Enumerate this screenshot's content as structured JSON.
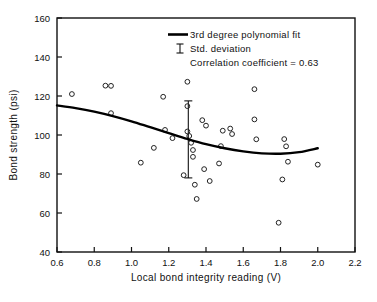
{
  "chart_data": {
    "type": "scatter",
    "title": "",
    "xlabel": "Local bond integrity reading (V)",
    "ylabel": "Bond strength (psi)",
    "xlim": [
      0.6,
      2.2
    ],
    "ylim": [
      40,
      160
    ],
    "xticks": [
      "0.6",
      "0.8",
      "1.0",
      "1.2",
      "1.4",
      "1.6",
      "1.8",
      "2.0",
      "2.2"
    ],
    "xtick_values": [
      0.6,
      0.8,
      1.0,
      1.2,
      1.4,
      1.6,
      1.8,
      2.0,
      2.2
    ],
    "yticks": [
      "40",
      "60",
      "80",
      "100",
      "120",
      "140",
      "160"
    ],
    "ytick_values": [
      40,
      60,
      80,
      100,
      120,
      140,
      160
    ],
    "grid": false,
    "legend_position": "top-right",
    "marker_style": "open-circle",
    "series": [
      {
        "name": "Bond strength measurements",
        "type": "scatter",
        "points": [
          [
            0.68,
            121.0
          ],
          [
            0.86,
            125.3
          ],
          [
            0.89,
            125.2
          ],
          [
            0.89,
            111.2
          ],
          [
            1.05,
            85.8
          ],
          [
            1.12,
            93.4
          ],
          [
            1.17,
            119.6
          ],
          [
            1.18,
            102.6
          ],
          [
            1.22,
            98.4
          ],
          [
            1.28,
            79.4
          ],
          [
            1.3,
            127.3
          ],
          [
            1.3,
            114.8
          ],
          [
            1.3,
            101.8
          ],
          [
            1.31,
            99.5
          ],
          [
            1.32,
            96.0
          ],
          [
            1.33,
            92.3
          ],
          [
            1.33,
            88.8
          ],
          [
            1.34,
            74.5
          ],
          [
            1.35,
            67.2
          ],
          [
            1.38,
            107.6
          ],
          [
            1.39,
            82.5
          ],
          [
            1.4,
            104.8
          ],
          [
            1.42,
            76.4
          ],
          [
            1.47,
            85.4
          ],
          [
            1.48,
            94.3
          ],
          [
            1.49,
            102.2
          ],
          [
            1.53,
            103.3
          ],
          [
            1.54,
            100.5
          ],
          [
            1.66,
            123.5
          ],
          [
            1.66,
            108.0
          ],
          [
            1.67,
            97.8
          ],
          [
            1.79,
            55.0
          ],
          [
            1.81,
            77.2
          ],
          [
            1.82,
            97.9
          ],
          [
            1.83,
            94.2
          ],
          [
            1.84,
            86.3
          ],
          [
            2.0,
            84.8
          ]
        ]
      },
      {
        "name": "3rd degree polynomial fit",
        "type": "line",
        "points": [
          [
            0.6,
            115.2
          ],
          [
            0.7,
            113.8
          ],
          [
            0.8,
            112.0
          ],
          [
            0.9,
            109.7
          ],
          [
            1.0,
            107.0
          ],
          [
            1.1,
            104.0
          ],
          [
            1.2,
            101.0
          ],
          [
            1.3,
            98.0
          ],
          [
            1.4,
            95.3
          ],
          [
            1.5,
            93.2
          ],
          [
            1.6,
            91.6
          ],
          [
            1.7,
            90.6
          ],
          [
            1.8,
            90.4
          ],
          [
            1.9,
            91.2
          ],
          [
            2.0,
            93.2
          ]
        ]
      }
    ],
    "error_bar": {
      "x": 1.305,
      "center": 98.0,
      "upper": 117.5,
      "lower": 78.0,
      "label": "Std. deviation"
    },
    "legend": [
      {
        "symbol": "line",
        "label": "3rd degree polynomial fit"
      },
      {
        "symbol": "ibar",
        "label": "Std. deviation"
      },
      {
        "symbol": "none",
        "label": "Correlation coefficient = 0.63"
      }
    ],
    "annotations": {
      "correlation_coefficient": "0.63"
    }
  }
}
